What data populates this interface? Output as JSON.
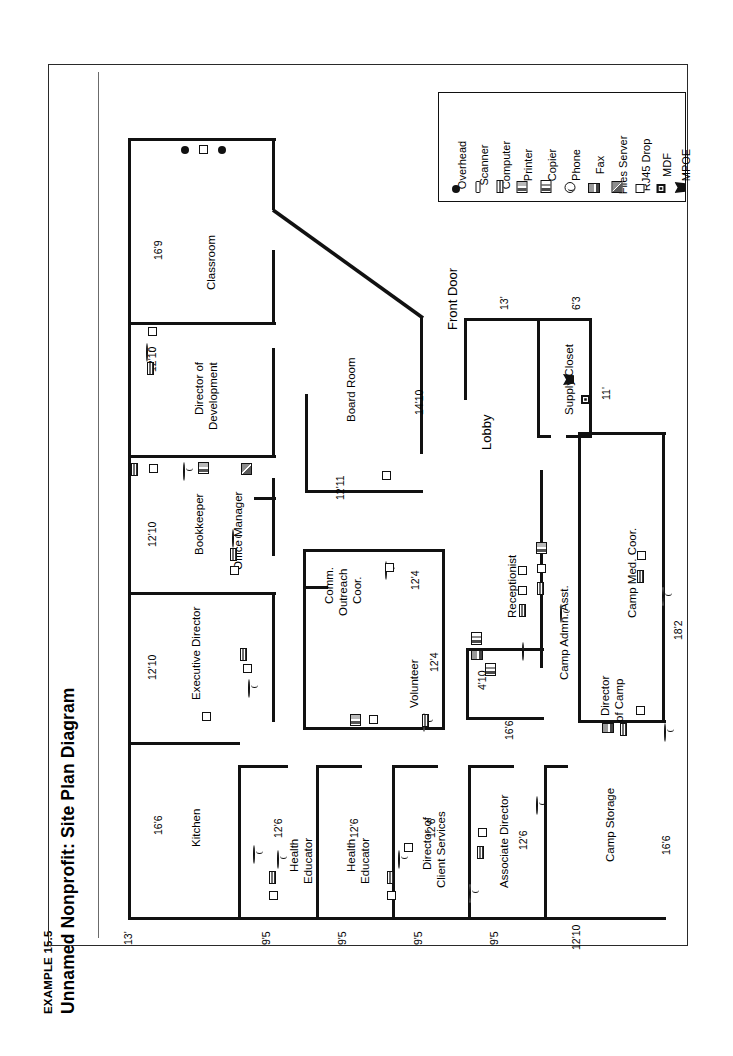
{
  "figure": {
    "kicker": "EXAMPLE 15.5",
    "title": "Unnamed Nonprofit: Site Plan Diagram"
  },
  "legend": {
    "items": [
      {
        "label": "Overhead",
        "icon": "overhead-icon"
      },
      {
        "label": "Scanner",
        "icon": "scanner-icon"
      },
      {
        "label": "Computer",
        "icon": "computer-icon"
      },
      {
        "label": "Printer",
        "icon": "printer-icon"
      },
      {
        "label": "Copier",
        "icon": "copier-icon"
      },
      {
        "label": "Phone",
        "icon": "phone-icon"
      },
      {
        "label": "Fax",
        "icon": "fax-icon"
      },
      {
        "label": "Files Server",
        "icon": "file-server-icon"
      },
      {
        "label": "RJ45 Drop",
        "icon": "rj45-drop-icon"
      },
      {
        "label": "MDF",
        "icon": "mdf-icon"
      },
      {
        "label": "MPOE",
        "icon": "mpoe-icon"
      }
    ]
  },
  "rooms": {
    "classroom": "Classroom",
    "director_of_development": "Director of\nDevelopment",
    "dev_line1": "Director of",
    "dev_line2": "Development",
    "board_room": "Board Room",
    "bookkeeper": "Bookkeeper",
    "office_manager": "Office Manager",
    "executive_director": "Executive Director",
    "kitchen": "Kitchen",
    "health_educator_1": "Health",
    "health_educator_1b": "Educator",
    "health_educator_2": "Health",
    "health_educator_2b": "Educator",
    "director_client_services_a": "Director of",
    "director_client_services_b": "Client Services",
    "associate_director": "Associate Director",
    "camp_storage": "Camp Storage",
    "comm_outreach_1": "Comm.",
    "comm_outreach_2": "Outreach",
    "comm_outreach_3": "Coor.",
    "volunteer": "Volunteer",
    "receptionist": "Receptionist",
    "camp_admin_asst": "Camp Admn. Asst.",
    "camp_med_coor": "Camp Med. Coor.",
    "director_of_camp_a": "Director",
    "director_of_camp_b": "of Camp",
    "lobby": "Lobby",
    "supply_closet": "Supply Closet",
    "front_door": "Front Door"
  },
  "dimensions": {
    "classroom_w": "16'9",
    "dev_w": "12'10",
    "bookkeeper_w": "12'10",
    "exec_dir_w": "12'10",
    "kitchen_w": "16'6",
    "board_room_h": "14'10",
    "board_room_h2": "12'11",
    "health_ed_1": "12'6",
    "health_ed_2": "12'6",
    "dir_client_w": "12'6",
    "assoc_dir_w": "12'6",
    "camp_storage_w": "16'6",
    "comm_outreach_h": "12'4",
    "volunteer_h": "12'4",
    "reception_h": "4'10",
    "reception_w": "16'6",
    "right_18_2": "18'2",
    "lobby_w": "13'",
    "supply_w": "6'3",
    "supply_h": "11'",
    "bottom_1": "13'",
    "bottom_2": "9'5",
    "bottom_3": "9'5",
    "bottom_4": "9'5",
    "bottom_5": "9'5",
    "bottom_6": "12'10"
  }
}
